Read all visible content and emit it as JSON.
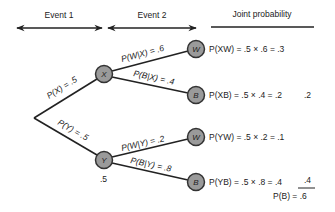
{
  "header": {
    "event1": "Event 1",
    "event2": "Event 2",
    "joint": "Joint probability"
  },
  "nodes": {
    "x": "X",
    "y": "Y",
    "xw": "W",
    "xb": "B",
    "yw": "W",
    "yb": "B"
  },
  "edges": {
    "px": "P(X) = .5",
    "py": "P(Y) = .5",
    "pw_given_x": "P(W|X) = .6",
    "pb_given_x": "P(B|X) = .4",
    "pw_given_y": "P(W|Y) = .2",
    "pb_given_y": "P(B|Y) = .8"
  },
  "joint": {
    "xw": "P(XW) = .5 × .6 = .3",
    "xb": "P(XB) = .5 × .4 = .2",
    "yw": "P(YW) = .5 × .2 = .1",
    "yb": "P(YB) = .5 × .8 = .4"
  },
  "sums": {
    "xb_side": ".2",
    "yb_side": ".4",
    "total": "P(B) = .6"
  },
  "y_node_note": ".5",
  "colors": {
    "node_fill": "#9a9a9a",
    "line": "#222222"
  }
}
